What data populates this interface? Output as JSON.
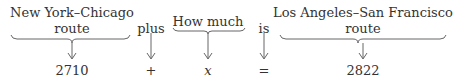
{
  "diagram": {
    "columns": [
      {
        "label_line1": "New York–Chicago",
        "label_line2": "route",
        "value": "2710"
      },
      {
        "label_line1": "plus",
        "value": "+"
      },
      {
        "label_line1": "How much",
        "value": "x"
      },
      {
        "label_line1": "is",
        "value": "="
      },
      {
        "label_line1": "Los Angeles–San Francisco",
        "label_line2": "route",
        "value": "2822"
      }
    ]
  }
}
